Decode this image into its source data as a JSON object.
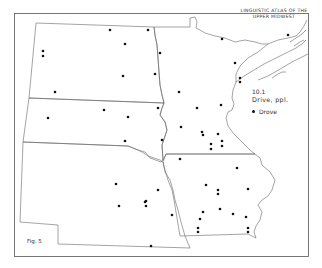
{
  "map": {
    "title_line1": "LINGUISTIC ATLAS OF THE",
    "title_line2": "UPPER MIDWEST",
    "item_code": "10.1",
    "item_heading": "Drive, ppl.",
    "legend": [
      {
        "symbol": "dot",
        "label": "Drove"
      }
    ],
    "figure_label": "Fig. 5",
    "colors": {
      "line": "#555555",
      "dot": "#111111",
      "background": "#ffffff"
    },
    "regions": [
      "North Dakota",
      "South Dakota",
      "Nebraska",
      "Minnesota",
      "Iowa"
    ],
    "dots": [
      [
        110,
        30
      ],
      [
        148,
        30
      ],
      [
        125,
        44
      ],
      [
        43,
        51
      ],
      [
        43,
        56
      ],
      [
        123,
        76
      ],
      [
        155,
        74
      ],
      [
        55,
        92
      ],
      [
        104,
        110
      ],
      [
        48,
        118
      ],
      [
        128,
        117
      ],
      [
        158,
        108
      ],
      [
        160,
        53
      ],
      [
        179,
        92
      ],
      [
        197,
        108
      ],
      [
        221,
        105
      ],
      [
        181,
        127
      ],
      [
        202,
        132
      ],
      [
        222,
        39
      ],
      [
        288,
        35
      ],
      [
        235,
        63
      ],
      [
        240,
        78
      ],
      [
        240,
        82
      ],
      [
        162,
        140
      ],
      [
        203,
        135
      ],
      [
        218,
        134
      ],
      [
        211,
        144
      ],
      [
        211,
        149
      ],
      [
        222,
        141
      ],
      [
        222,
        146
      ],
      [
        180,
        159
      ],
      [
        237,
        168
      ],
      [
        125,
        141
      ],
      [
        116,
        184
      ],
      [
        158,
        190
      ],
      [
        119,
        206
      ],
      [
        146,
        201
      ],
      [
        146,
        206
      ],
      [
        151,
        246
      ],
      [
        145,
        202
      ],
      [
        172,
        215
      ],
      [
        206,
        185
      ],
      [
        218,
        190
      ],
      [
        218,
        194
      ],
      [
        248,
        189
      ],
      [
        203,
        212
      ],
      [
        200,
        219
      ],
      [
        220,
        209
      ],
      [
        233,
        214
      ],
      [
        246,
        217
      ],
      [
        198,
        228
      ],
      [
        198,
        232
      ],
      [
        248,
        228
      ],
      [
        248,
        232
      ]
    ]
  }
}
